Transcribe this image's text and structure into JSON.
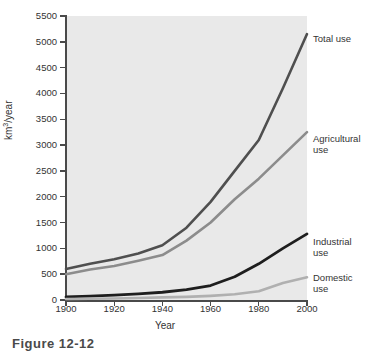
{
  "chart_data": {
    "type": "line",
    "title": "",
    "xlabel": "Year",
    "ylabel": "km3/year",
    "ylabel_base": "km",
    "ylabel_sup": "3",
    "ylabel_tail": "/year",
    "xlim": [
      1900,
      2000
    ],
    "ylim": [
      0,
      5500
    ],
    "grid": false,
    "legend_position": "right-inline-labels",
    "x_ticks": [
      "1900",
      "1920",
      "1940",
      "1960",
      "1980",
      "2000"
    ],
    "y_ticks": [
      "0",
      "500",
      "1000",
      "1500",
      "2000",
      "2500",
      "3000",
      "3500",
      "4000",
      "4500",
      "5000",
      "5500"
    ],
    "x": [
      1900,
      1910,
      1920,
      1930,
      1940,
      1950,
      1960,
      1970,
      1980,
      1990,
      2000
    ],
    "series": [
      {
        "name": "Total use",
        "label": "Total use",
        "color": "#4f4f4f",
        "width": 2.6,
        "values": [
          600,
          700,
          790,
          900,
          1060,
          1400,
          1900,
          2500,
          3100,
          4100,
          5150
        ]
      },
      {
        "name": "Agricultural use",
        "label": "Agricultural\nuse",
        "color": "#8c8c8c",
        "width": 2.6,
        "values": [
          500,
          590,
          660,
          760,
          870,
          1150,
          1500,
          1950,
          2350,
          2800,
          3250
        ]
      },
      {
        "name": "Industrial use",
        "label": "Industrial\nuse",
        "color": "#1e1e1e",
        "width": 2.8,
        "values": [
          60,
          75,
          95,
          120,
          150,
          200,
          280,
          450,
          700,
          1000,
          1280
        ]
      },
      {
        "name": "Domestic use",
        "label": "Domestic\nuse",
        "color": "#b0b0b0",
        "width": 2.6,
        "values": [
          20,
          25,
          30,
          40,
          50,
          60,
          80,
          110,
          170,
          330,
          440
        ]
      }
    ],
    "annotations": [
      "Total use",
      "Agricultural use",
      "Industrial use",
      "Domestic use"
    ]
  },
  "legend": {
    "total": "Total use",
    "agricultural": "Agricultural\nuse",
    "industrial": "Industrial\nuse",
    "domestic": "Domestic\nuse"
  },
  "axes": {
    "x_title": "Year",
    "y_title_base": "km",
    "y_title_sup": "3",
    "y_title_tail": "/year"
  },
  "caption": {
    "text": "Figure 12-12"
  }
}
